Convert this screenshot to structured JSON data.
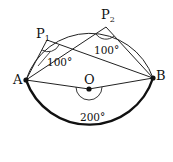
{
  "points": {
    "A": {
      "label": "A",
      "x": 26,
      "y": 80
    },
    "B": {
      "label": "B",
      "x": 153,
      "y": 78
    },
    "O": {
      "label": "O",
      "x": 89,
      "y": 89
    },
    "P1": {
      "label": "P",
      "sub": "1",
      "x": 47,
      "y": 40
    },
    "P2": {
      "label": "P",
      "sub": "2",
      "x": 106,
      "y": 27
    }
  },
  "angles": {
    "p1_angle": "100°",
    "p2_angle": "100°",
    "center_angle": "200°"
  },
  "circle": {
    "cx": 89,
    "cy": 90,
    "r": 67
  },
  "colors": {
    "line": "#222222",
    "thick_arc": "#111111"
  }
}
